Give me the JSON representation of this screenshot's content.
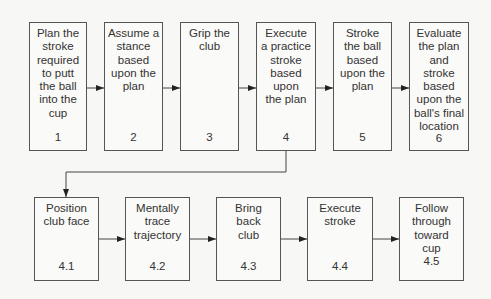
{
  "top_row": [
    {
      "lines": [
        "Plan the",
        "stroke",
        "required",
        "to putt",
        "the ball",
        "into the",
        "cup"
      ],
      "num": "1"
    },
    {
      "lines": [
        "Assume a",
        "stance",
        "based",
        "upon the",
        "plan"
      ],
      "num": "2"
    },
    {
      "lines": [
        "Grip the",
        "club"
      ],
      "num": "3"
    },
    {
      "lines": [
        "Execute",
        "a practice",
        "stroke",
        "based",
        "upon",
        "the plan"
      ],
      "num": "4"
    },
    {
      "lines": [
        "Stroke",
        "the ball",
        "based",
        "upon the",
        "plan"
      ],
      "num": "5"
    },
    {
      "lines": [
        "Evaluate",
        "the plan",
        "and",
        "stroke",
        "based",
        "upon the",
        "ball's final",
        "location"
      ],
      "num": "6"
    }
  ],
  "bottom_row": [
    {
      "lines": [
        "Position",
        "club face"
      ],
      "num": "4.1"
    },
    {
      "lines": [
        "Mentally",
        "trace",
        "trajectory"
      ],
      "num": "4.2"
    },
    {
      "lines": [
        "Bring",
        "back",
        "club"
      ],
      "num": "4.3"
    },
    {
      "lines": [
        "Execute",
        "stroke"
      ],
      "num": "4.4"
    },
    {
      "lines": [
        "Follow",
        "through",
        "toward",
        "cup"
      ],
      "num": "4.5"
    }
  ]
}
